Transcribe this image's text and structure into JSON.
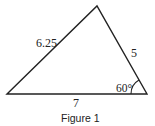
{
  "figure": {
    "caption": "Figure 1",
    "shape": "triangle",
    "sides": {
      "left": "6.25",
      "right": "5",
      "bottom": "7"
    },
    "angles": {
      "bottom_right": "60°"
    },
    "colors": {
      "stroke": "#222222",
      "background": "#ffffff"
    }
  }
}
